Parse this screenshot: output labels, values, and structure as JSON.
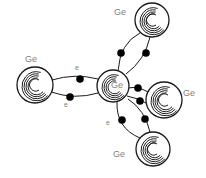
{
  "diagram": {
    "title": "",
    "atoms": [
      {
        "id": "center",
        "label": "Ge",
        "cx": 113,
        "cy": 86,
        "r": 16
      },
      {
        "id": "left",
        "label": "Ge",
        "cx": 35,
        "cy": 85,
        "r": 18
      },
      {
        "id": "top-right",
        "label": "Ge",
        "cx": 152,
        "cy": 20,
        "r": 17
      },
      {
        "id": "right",
        "label": "Ge",
        "cx": 164,
        "cy": 100,
        "r": 18
      },
      {
        "id": "bottom-right",
        "label": "Ge",
        "cx": 153,
        "cy": 149,
        "r": 17
      }
    ],
    "labels": {
      "center": "Ge",
      "left": "Ge",
      "top_right": "Ge",
      "right": "Ge",
      "bottom_right": "Ge",
      "electron_1": "e",
      "electron_2": "e",
      "electron_3": "e"
    },
    "bonds": [
      {
        "from": "center",
        "to": "left",
        "electrons": 2
      },
      {
        "from": "center",
        "to": "top-right",
        "electrons": 2
      },
      {
        "from": "center",
        "to": "right",
        "electrons": 2
      },
      {
        "from": "center",
        "to": "bottom-right",
        "electrons": 2
      }
    ],
    "colors": {
      "line": "#1a1a1a",
      "label": "#808080",
      "electron": "#000000"
    }
  }
}
